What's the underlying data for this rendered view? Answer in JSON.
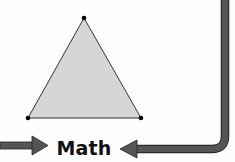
{
  "diagram": {
    "label": "Math",
    "shape": {
      "type": "triangle",
      "vertices": [
        [
          84,
          18
        ],
        [
          28,
          118
        ],
        [
          141,
          118
        ]
      ],
      "fill": "#d6d6d6",
      "stroke": "#333333",
      "vertex_dot_color": "#000000"
    },
    "arrows": [
      {
        "name": "left-arrow",
        "direction": "right",
        "color": "#555555"
      },
      {
        "name": "right-return-arrow",
        "direction": "left",
        "color": "#555555",
        "path": "down-then-left"
      }
    ]
  }
}
